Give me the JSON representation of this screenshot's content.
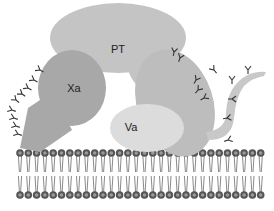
{
  "diagram": {
    "type": "prothrombinase complex on phospholipid membrane",
    "labels": {
      "pt": "PT",
      "xa": "Xa",
      "va": "Va"
    },
    "colors": {
      "pt": "#c4c4c4",
      "xa": "#a8a8a8",
      "va": "#dcdcdc",
      "va_body": "#bdbdbd",
      "tail": "#c8c8c8",
      "lipid_head": "#555555",
      "lipid_head_center": "#9a9a9a",
      "lipid_tail": "#8a8a8a",
      "glyco": "#333333"
    },
    "membrane": {
      "head_count": 30,
      "x_start": 20,
      "spacing": 8.3,
      "top_y": 153,
      "bottom_y": 195
    }
  }
}
